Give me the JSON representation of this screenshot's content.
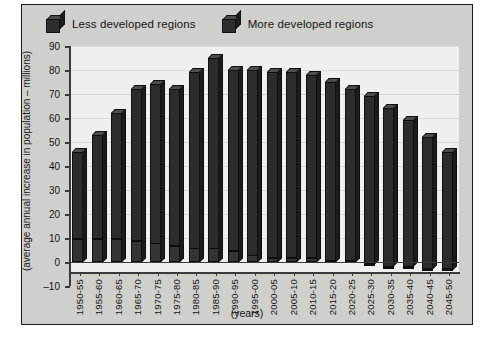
{
  "chart_data": {
    "type": "bar",
    "subtype": "stacked-column-3d",
    "title": "",
    "xlabel": "(years)",
    "ylabel": "(average annual increase in population – millions)",
    "ylim": [
      -10,
      90
    ],
    "ytick_values": [
      -10,
      0,
      10,
      20,
      30,
      40,
      50,
      60,
      70,
      80,
      90
    ],
    "ytick_labels": [
      "–10",
      "0",
      "10",
      "20",
      "30",
      "40",
      "50",
      "60",
      "70",
      "80",
      "90"
    ],
    "grid": true,
    "legend_position": "top-left",
    "categories": [
      "1950-55",
      "1955-60",
      "1960-65",
      "1965-70",
      "1970-75",
      "1975-80",
      "1980-85",
      "1985-90",
      "1990-95",
      "1995-00",
      "2000-05",
      "2005-10",
      "2010-15",
      "2015-20",
      "2020-25",
      "2025-30",
      "2030-35",
      "2035-40",
      "2040-45",
      "2045-50"
    ],
    "series": [
      {
        "name": "More developed regions",
        "color": "#343434",
        "values": [
          10,
          10,
          10,
          9,
          8,
          7,
          6,
          6,
          5,
          3,
          2,
          2,
          2,
          1,
          1,
          -1,
          -2,
          -2,
          -3,
          -3
        ]
      },
      {
        "name": "Less developed regions",
        "color": "#2c2c2c",
        "values": [
          36,
          43,
          52,
          63,
          66,
          65,
          73,
          79,
          75,
          77,
          77,
          77,
          76,
          74,
          71,
          69,
          64,
          59,
          52,
          46
        ]
      }
    ],
    "totals": [
      46,
      53,
      62,
      72,
      74,
      72,
      79,
      85,
      80,
      80,
      79,
      79,
      78,
      75,
      72,
      68,
      62,
      57,
      49,
      43
    ]
  },
  "legend": {
    "items": [
      {
        "label": "Less developed regions",
        "icon": "cube-icon"
      },
      {
        "label": "More developed regions",
        "icon": "cube-icon"
      }
    ]
  }
}
